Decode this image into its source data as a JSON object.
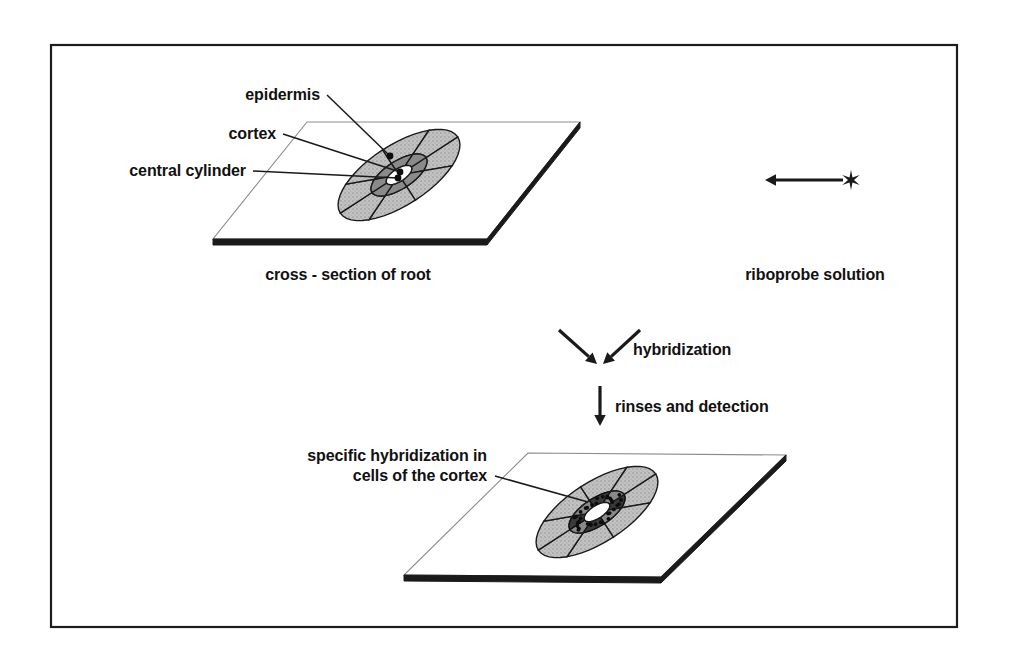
{
  "figure": {
    "background_color": "#ffffff",
    "frame": {
      "x": 51,
      "y": 45,
      "width": 906,
      "height": 582,
      "stroke_color": "#1d1d1d"
    },
    "colors": {
      "ink": "#1a1a1a",
      "cortex_fill": "#bdbdbd",
      "stele_fill": "#8a8a8a",
      "signal_fill": "#3a3a3a",
      "lumen_fill": "#ffffff",
      "slide_edge": "#1a1a1a",
      "slide_outline": "#8c8c8c"
    }
  },
  "top_panel": {
    "caption": "cross - section of root",
    "caption_pos": {
      "x": 348,
      "y": 280
    },
    "slide": {
      "top_left": {
        "x": 307,
        "y": 122
      },
      "top_right": {
        "x": 580,
        "y": 122
      },
      "bottom_right": {
        "x": 487,
        "y": 239
      },
      "bottom_left": {
        "x": 213,
        "y": 239
      }
    },
    "section": {
      "center": {
        "x": 399,
        "y": 175
      },
      "radius_x": 70,
      "radius_y": 30,
      "rotation_deg": -33,
      "cortex_cell_count": 8,
      "stele_cell_count": 8,
      "has_signal": false
    },
    "labels": [
      {
        "id": "epidermis",
        "text": "epidermis",
        "text_anchor": {
          "x": 320,
          "y": 100
        },
        "leader_from": {
          "x": 327,
          "y": 95
        },
        "leader_to": {
          "x": 390,
          "y": 156
        },
        "dot": {
          "x": 390,
          "y": 156
        }
      },
      {
        "id": "cortex",
        "text": "cortex",
        "text_anchor": {
          "x": 276,
          "y": 139
        },
        "leader_from": {
          "x": 283,
          "y": 134
        },
        "leader_to": {
          "x": 400,
          "y": 172
        },
        "dot": {
          "x": 400,
          "y": 172
        }
      },
      {
        "id": "central-cylinder",
        "text": "central cylinder",
        "text_anchor": {
          "x": 246,
          "y": 176
        },
        "leader_from": {
          "x": 253,
          "y": 171
        },
        "leader_to": {
          "x": 398,
          "y": 178
        },
        "dot": {
          "x": 398,
          "y": 178
        }
      }
    ]
  },
  "probe": {
    "caption": "riboprobe solution",
    "caption_pos": {
      "x": 815,
      "y": 280
    },
    "arrow": {
      "from": {
        "x": 843,
        "y": 180
      },
      "to": {
        "x": 765,
        "y": 180
      },
      "head_size": 11
    },
    "star": {
      "center": {
        "x": 851,
        "y": 180
      },
      "radius": 10,
      "points": 6,
      "semantic": "radioactive-label-asterisk"
    }
  },
  "steps": [
    {
      "id": "hybridization",
      "label": "hybridization",
      "label_pos": {
        "x": 633,
        "y": 355
      },
      "arrows": [
        {
          "from": {
            "x": 559,
            "y": 330
          },
          "to": {
            "x": 597,
            "y": 364
          }
        },
        {
          "from": {
            "x": 640,
            "y": 330
          },
          "to": {
            "x": 603,
            "y": 364
          }
        }
      ]
    },
    {
      "id": "rinses-and-detection",
      "label": "rinses and detection",
      "label_pos": {
        "x": 615,
        "y": 412
      },
      "arrows": [
        {
          "from": {
            "x": 600,
            "y": 386
          },
          "to": {
            "x": 600,
            "y": 426
          }
        }
      ]
    }
  ],
  "bottom_panel": {
    "slide": {
      "top_left": {
        "x": 528,
        "y": 453
      },
      "top_right": {
        "x": 786,
        "y": 455
      },
      "bottom_right": {
        "x": 661,
        "y": 577
      },
      "bottom_left": {
        "x": 404,
        "y": 575
      }
    },
    "section": {
      "center": {
        "x": 597,
        "y": 512
      },
      "radius_x": 70,
      "radius_y": 30,
      "rotation_deg": -33,
      "cortex_cell_count": 8,
      "stele_cell_count": 8,
      "has_signal": true,
      "grain_count": 34
    },
    "labels": [
      {
        "id": "specific-hybridization",
        "line1": "specific hybridization in",
        "line2": "cells of the cortex",
        "text_anchor": {
          "x": 487,
          "y": 461
        },
        "line_height": 20,
        "leader_from": {
          "x": 495,
          "y": 476
        },
        "leader_to": {
          "x": 588,
          "y": 502
        }
      }
    ]
  }
}
